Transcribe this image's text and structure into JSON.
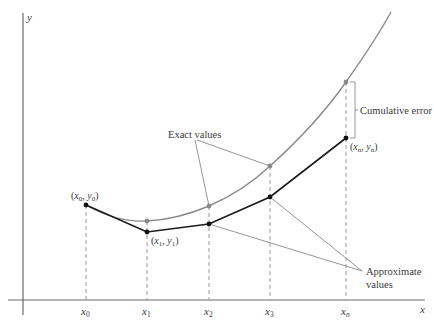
{
  "diagram": {
    "axes": {
      "x_label": "x",
      "y_label": "y"
    },
    "ticks": [
      {
        "base": "x",
        "sub": "0"
      },
      {
        "base": "x",
        "sub": "1"
      },
      {
        "base": "x",
        "sub": "2"
      },
      {
        "base": "x",
        "sub": "3"
      },
      {
        "base": "x",
        "sub": "n"
      }
    ],
    "point_labels": {
      "p0": {
        "open": "(",
        "x": "x",
        "xsub": "0",
        "sep": ", ",
        "y": "y",
        "ysub": "0",
        "close": ")"
      },
      "p1": {
        "open": "(",
        "x": "x",
        "xsub": "1",
        "sep": ", ",
        "y": "y",
        "ysub": "1",
        "close": ")"
      },
      "pn": {
        "open": "(",
        "x": "x",
        "xsub": "n",
        "sep": ", ",
        "y": "y",
        "ysub": "n",
        "close": ")"
      }
    },
    "annotations": {
      "exact_values": "Exact values",
      "cumulative_error": "Cumulative error",
      "approximate_line1": "Approximate",
      "approximate_line2": "values"
    },
    "colors": {
      "exact_curve": "#8a8a8a",
      "approx_polyline": "#1a1a1a",
      "axes": "#555555",
      "dashed_guides": "#9a9a9a",
      "leader_lines": "#8a8a8a"
    },
    "exact_points": [
      [
        86,
        205
      ],
      [
        147,
        221
      ],
      [
        209,
        206
      ],
      [
        270,
        166
      ],
      [
        346,
        82
      ]
    ],
    "approx_points": [
      [
        86,
        205
      ],
      [
        147,
        232
      ],
      [
        209,
        224
      ],
      [
        270,
        197
      ],
      [
        346,
        138
      ]
    ]
  }
}
